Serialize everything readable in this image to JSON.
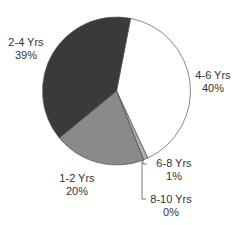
{
  "chart_data": {
    "type": "pie",
    "title": "",
    "categories": [
      "4-6 Yrs",
      "6-8 Yrs",
      "8-10 Yrs",
      "1-2 Yrs",
      "2-4 Yrs"
    ],
    "values": [
      40,
      1,
      0,
      20,
      39
    ],
    "value_labels": [
      "40%",
      "1%",
      "0%",
      "20%",
      "39%"
    ],
    "colors": [
      "#ffffff",
      "#b0b0b0",
      "#c8c8c8",
      "#8a8a8a",
      "#3a3a3a"
    ],
    "start_angle_deg": 11,
    "direction": "clockwise",
    "legend": "none"
  },
  "labels": {
    "l46": {
      "name": "4-6 Yrs",
      "pct": "40%"
    },
    "l68": {
      "name": "6-8 Yrs",
      "pct": "1%"
    },
    "l810": {
      "name": "8-10 Yrs",
      "pct": "0%"
    },
    "l12": {
      "name": "1-2 Yrs",
      "pct": "20%"
    },
    "l24": {
      "name": "2-4 Yrs",
      "pct": "39%"
    }
  }
}
